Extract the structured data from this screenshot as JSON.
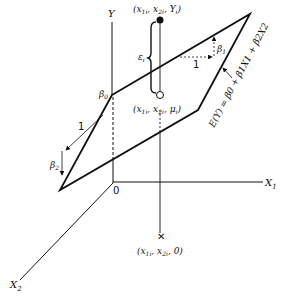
{
  "diagram": {
    "type": "3d-regression-plane",
    "axes": {
      "y_label": "Y",
      "x1_label": "X",
      "x1_sub": "1",
      "x2_label": "X",
      "x2_sub": "2",
      "origin_label": "0"
    },
    "points": {
      "observed_label": "(x1i, x2i, Yi)",
      "observed_parts": [
        "(x",
        "1i",
        ", x",
        "2i",
        ", Y",
        "i",
        ")"
      ],
      "fitted_label": "(x1i, x2i, μi)",
      "fitted_parts": [
        "(x",
        "1i",
        ", x",
        "2i",
        ", μ",
        "i",
        ")"
      ],
      "base_label": "(x1i, x2i, 0)",
      "base_parts": [
        "(x",
        "1i",
        ", x",
        "2i",
        ", 0)"
      ]
    },
    "annotations": {
      "error_label": "ε",
      "error_sub": "i",
      "intercept_label": "β",
      "intercept_sub": "0",
      "slope1_label": "β",
      "slope1_sub": "1",
      "slope2_label": "β",
      "slope2_sub": "2",
      "unit1_label": "1",
      "unit2_label": "1",
      "plane_equation": "E(Y) = β0 + β1X1 + β2X2"
    }
  }
}
